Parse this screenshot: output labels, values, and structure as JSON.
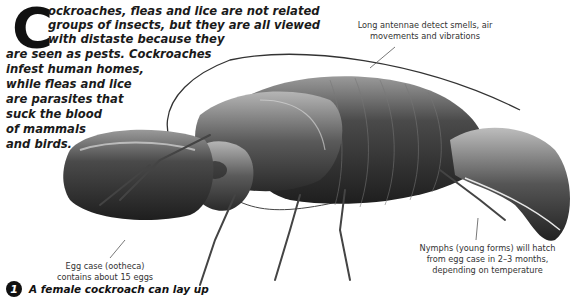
{
  "intro": {
    "dropcap": "C",
    "lines": [
      "ockroaches, fleas and lice are not related",
      "groups of insects, but they are all viewed",
      "with distaste because they",
      "are seen as pests. Cockroaches",
      "infest human homes,",
      "while fleas and lice",
      "are parasites that",
      "suck the blood",
      "of mammals",
      "and birds."
    ]
  },
  "illustration": {
    "subject": "cockroach-with-egg-case",
    "colors": {
      "body_dark": "#2b2b2b",
      "body_mid": "#6a6a6a",
      "highlight": "#cfcfcf",
      "leader_line": "#555555"
    }
  },
  "labels": {
    "antennae": [
      "Long antennae detect smells, air",
      "movements and vibrations"
    ],
    "egg_case": [
      "Egg case (ootheca)",
      "contains about 15 eggs"
    ],
    "nymphs": [
      "Nymphs (young forms) will hatch",
      "from egg case in 2–3 months,",
      "depending on temperature"
    ]
  },
  "fact": {
    "icon": "1",
    "text": "A female cockroach can lay up"
  }
}
